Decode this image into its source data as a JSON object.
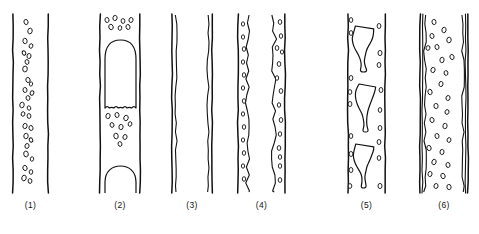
{
  "figure": {
    "title": "",
    "panel_count": 6,
    "background_color": "#ffffff",
    "ink_color": "#111111",
    "tube_top_y": 14,
    "tube_bottom_y": 193,
    "caption_y": 200
  },
  "panels": [
    {
      "id": "panel-1",
      "label": "(1)",
      "regime": "bubbly-flow",
      "x": 0,
      "width": 80,
      "wall_left": 13,
      "wall_right": 48,
      "wall_style": "single",
      "inner_film": false,
      "large_bubbles": [],
      "bubbles": [
        {
          "cx": 26,
          "cy": 22,
          "rx": 2.0,
          "ry": 2.6,
          "rot": -18
        },
        {
          "cx": 30,
          "cy": 31,
          "rx": 2.2,
          "ry": 2.8,
          "rot": 12
        },
        {
          "cx": 25,
          "cy": 41,
          "rx": 2.1,
          "ry": 2.7,
          "rot": -10
        },
        {
          "cx": 31,
          "cy": 46,
          "rx": 1.8,
          "ry": 2.3,
          "rot": 20
        },
        {
          "cx": 24,
          "cy": 53,
          "rx": 1.7,
          "ry": 2.2,
          "rot": -25
        },
        {
          "cx": 29,
          "cy": 56,
          "rx": 2.0,
          "ry": 2.5,
          "rot": 8
        },
        {
          "cx": 27,
          "cy": 62,
          "rx": 1.9,
          "ry": 2.4,
          "rot": -14
        },
        {
          "cx": 25,
          "cy": 69,
          "rx": 2.3,
          "ry": 2.9,
          "rot": 6
        },
        {
          "cx": 28,
          "cy": 80,
          "rx": 2.1,
          "ry": 2.6,
          "rot": -20
        },
        {
          "cx": 31,
          "cy": 84,
          "rx": 1.6,
          "ry": 2.1,
          "rot": 15
        },
        {
          "cx": 25,
          "cy": 90,
          "rx": 2.0,
          "ry": 2.5,
          "rot": -8
        },
        {
          "cx": 32,
          "cy": 93,
          "rx": 1.8,
          "ry": 2.3,
          "rot": 22
        },
        {
          "cx": 28,
          "cy": 98,
          "rx": 1.9,
          "ry": 2.4,
          "rot": -12
        },
        {
          "cx": 22,
          "cy": 105,
          "rx": 2.2,
          "ry": 2.8,
          "rot": 10
        },
        {
          "cx": 29,
          "cy": 108,
          "rx": 1.7,
          "ry": 2.2,
          "rot": -18
        },
        {
          "cx": 23,
          "cy": 114,
          "rx": 1.8,
          "ry": 2.3,
          "rot": 16
        },
        {
          "cx": 29,
          "cy": 116,
          "rx": 1.9,
          "ry": 2.4,
          "rot": -6
        },
        {
          "cx": 25,
          "cy": 126,
          "rx": 2.1,
          "ry": 2.6,
          "rot": 14
        },
        {
          "cx": 31,
          "cy": 128,
          "rx": 2.0,
          "ry": 2.5,
          "rot": -16
        },
        {
          "cx": 26,
          "cy": 136,
          "rx": 2.2,
          "ry": 2.7,
          "rot": 8
        },
        {
          "cx": 31,
          "cy": 140,
          "rx": 1.7,
          "ry": 2.2,
          "rot": -22
        },
        {
          "cx": 27,
          "cy": 146,
          "rx": 2.0,
          "ry": 2.5,
          "rot": 18
        },
        {
          "cx": 26,
          "cy": 154,
          "rx": 2.3,
          "ry": 2.9,
          "rot": -10
        },
        {
          "cx": 32,
          "cy": 159,
          "rx": 1.7,
          "ry": 2.2,
          "rot": 12
        },
        {
          "cx": 25,
          "cy": 168,
          "rx": 2.1,
          "ry": 2.6,
          "rot": -20
        },
        {
          "cx": 31,
          "cy": 172,
          "rx": 1.8,
          "ry": 2.3,
          "rot": 6
        },
        {
          "cx": 24,
          "cy": 178,
          "rx": 2.2,
          "ry": 2.8,
          "rot": 16
        },
        {
          "cx": 30,
          "cy": 181,
          "rx": 1.9,
          "ry": 2.4,
          "rot": -8
        }
      ]
    },
    {
      "id": "panel-2",
      "label": "(2)",
      "regime": "slug-flow",
      "x": 80,
      "width": 80,
      "wall_left": 100,
      "wall_right": 140,
      "wall_style": "single",
      "inner_film": false,
      "large_bubbles": [
        {
          "type": "taylor",
          "top": 40,
          "bottom": 108,
          "left": 105,
          "right": 136
        },
        {
          "type": "cap",
          "top": 166,
          "bottom": 193,
          "left": 105,
          "right": 136
        }
      ],
      "bubbles": [
        {
          "cx": 107,
          "cy": 20,
          "rx": 2.0,
          "ry": 2.5,
          "rot": -12
        },
        {
          "cx": 115,
          "cy": 18,
          "rx": 2.1,
          "ry": 2.6,
          "rot": 10
        },
        {
          "cx": 123,
          "cy": 21,
          "rx": 1.9,
          "ry": 2.4,
          "rot": -6
        },
        {
          "cx": 131,
          "cy": 20,
          "rx": 2.0,
          "ry": 2.5,
          "rot": 16
        },
        {
          "cx": 111,
          "cy": 27,
          "rx": 2.2,
          "ry": 2.7,
          "rot": -18
        },
        {
          "cx": 120,
          "cy": 28,
          "rx": 1.8,
          "ry": 2.3,
          "rot": 8
        },
        {
          "cx": 128,
          "cy": 27,
          "rx": 2.0,
          "ry": 2.5,
          "rot": -14
        },
        {
          "cx": 108,
          "cy": 116,
          "rx": 2.1,
          "ry": 2.6,
          "rot": 12
        },
        {
          "cx": 117,
          "cy": 115,
          "rx": 2.0,
          "ry": 2.5,
          "rot": -10
        },
        {
          "cx": 126,
          "cy": 118,
          "rx": 2.2,
          "ry": 2.7,
          "rot": 18
        },
        {
          "cx": 112,
          "cy": 125,
          "rx": 1.9,
          "ry": 2.4,
          "rot": -20
        },
        {
          "cx": 121,
          "cy": 127,
          "rx": 2.1,
          "ry": 2.6,
          "rot": 6
        },
        {
          "cx": 130,
          "cy": 124,
          "rx": 1.8,
          "ry": 2.3,
          "rot": 14
        },
        {
          "cx": 116,
          "cy": 136,
          "rx": 2.2,
          "ry": 2.8,
          "rot": -8
        },
        {
          "cx": 125,
          "cy": 137,
          "rx": 2.0,
          "ry": 2.5,
          "rot": 20
        },
        {
          "cx": 120,
          "cy": 144,
          "rx": 1.9,
          "ry": 2.4,
          "rot": -16
        }
      ]
    },
    {
      "id": "panel-3",
      "label": "(3)",
      "regime": "annular-flow",
      "x": 160,
      "width": 80,
      "wall_left": 172,
      "wall_right": 212,
      "wall_style": "single",
      "inner_film": true,
      "film_left_x": 176,
      "film_right_x": 208,
      "large_bubbles": [],
      "bubbles": []
    },
    {
      "id": "panel-4",
      "label": "(4)",
      "regime": "wavy-annular-flow",
      "x": 240,
      "width": 80,
      "wall_left": 238,
      "wall_right": 285,
      "wall_style": "single",
      "inner_film": true,
      "film_left_x": 248,
      "film_right_x": 274,
      "large_bubbles": [],
      "bubbles": [
        {
          "cx": 243,
          "cy": 24,
          "rx": 1.6,
          "ry": 2.2,
          "rot": 0
        },
        {
          "cx": 243,
          "cy": 37,
          "rx": 1.6,
          "ry": 2.2,
          "rot": 0
        },
        {
          "cx": 244,
          "cy": 49,
          "rx": 1.7,
          "ry": 2.3,
          "rot": 0
        },
        {
          "cx": 243,
          "cy": 62,
          "rx": 1.6,
          "ry": 2.2,
          "rot": 0
        },
        {
          "cx": 244,
          "cy": 75,
          "rx": 1.7,
          "ry": 2.3,
          "rot": 0
        },
        {
          "cx": 243,
          "cy": 88,
          "rx": 1.6,
          "ry": 2.2,
          "rot": 0
        },
        {
          "cx": 244,
          "cy": 101,
          "rx": 1.7,
          "ry": 2.3,
          "rot": 0
        },
        {
          "cx": 243,
          "cy": 114,
          "rx": 1.6,
          "ry": 2.2,
          "rot": 0
        },
        {
          "cx": 244,
          "cy": 127,
          "rx": 1.7,
          "ry": 2.3,
          "rot": 0
        },
        {
          "cx": 243,
          "cy": 140,
          "rx": 1.6,
          "ry": 2.2,
          "rot": 0
        },
        {
          "cx": 244,
          "cy": 153,
          "rx": 1.7,
          "ry": 2.3,
          "rot": 0
        },
        {
          "cx": 243,
          "cy": 166,
          "rx": 1.6,
          "ry": 2.2,
          "rot": 0
        },
        {
          "cx": 244,
          "cy": 179,
          "rx": 1.7,
          "ry": 2.3,
          "rot": 0
        },
        {
          "cx": 280,
          "cy": 22,
          "rx": 1.8,
          "ry": 2.4,
          "rot": 0
        },
        {
          "cx": 281,
          "cy": 36,
          "rx": 1.7,
          "ry": 2.3,
          "rot": 0
        },
        {
          "cx": 277,
          "cy": 48,
          "rx": 1.8,
          "ry": 2.4,
          "rot": 0
        },
        {
          "cx": 282,
          "cy": 52,
          "rx": 1.6,
          "ry": 2.1,
          "rot": 0
        },
        {
          "cx": 279,
          "cy": 64,
          "rx": 1.8,
          "ry": 2.4,
          "rot": 0
        },
        {
          "cx": 277,
          "cy": 78,
          "rx": 1.7,
          "ry": 2.3,
          "rot": 0
        },
        {
          "cx": 281,
          "cy": 91,
          "rx": 1.8,
          "ry": 2.4,
          "rot": 0
        },
        {
          "cx": 279,
          "cy": 105,
          "rx": 1.7,
          "ry": 2.3,
          "rot": 0
        },
        {
          "cx": 281,
          "cy": 120,
          "rx": 1.8,
          "ry": 2.4,
          "rot": 0
        },
        {
          "cx": 280,
          "cy": 134,
          "rx": 1.7,
          "ry": 2.3,
          "rot": 0
        },
        {
          "cx": 279,
          "cy": 148,
          "rx": 1.8,
          "ry": 2.4,
          "rot": 0
        },
        {
          "cx": 280,
          "cy": 157,
          "rx": 1.7,
          "ry": 2.3,
          "rot": 0
        },
        {
          "cx": 280,
          "cy": 166,
          "rx": 1.7,
          "ry": 2.3,
          "rot": 0
        },
        {
          "cx": 280,
          "cy": 180,
          "rx": 1.8,
          "ry": 2.4,
          "rot": 0
        }
      ]
    },
    {
      "id": "panel-5",
      "label": "(5)",
      "regime": "churn-flow",
      "x": 320,
      "width": 80,
      "wall_left": 348,
      "wall_right": 385,
      "wall_style": "single",
      "inner_film": false,
      "large_bubbles": [
        {
          "type": "blob",
          "top": 26,
          "bottom": 72,
          "left": 352,
          "right": 374
        },
        {
          "type": "blob",
          "top": 84,
          "bottom": 132,
          "left": 355,
          "right": 376
        },
        {
          "type": "blob",
          "top": 144,
          "bottom": 188,
          "left": 353,
          "right": 374
        }
      ],
      "bubbles": [
        {
          "cx": 351,
          "cy": 20,
          "rx": 1.8,
          "ry": 2.4,
          "rot": 0
        },
        {
          "cx": 351,
          "cy": 33,
          "rx": 1.8,
          "ry": 2.4,
          "rot": 0
        },
        {
          "cx": 379,
          "cy": 26,
          "rx": 1.9,
          "ry": 2.5,
          "rot": 0
        },
        {
          "cx": 380,
          "cy": 53,
          "rx": 2.0,
          "ry": 2.6,
          "rot": 0
        },
        {
          "cx": 379,
          "cy": 65,
          "rx": 1.9,
          "ry": 2.5,
          "rot": 0
        },
        {
          "cx": 351,
          "cy": 78,
          "rx": 1.9,
          "ry": 2.5,
          "rot": 0
        },
        {
          "cx": 350,
          "cy": 92,
          "rx": 1.8,
          "ry": 2.4,
          "rot": 0
        },
        {
          "cx": 350,
          "cy": 104,
          "rx": 1.9,
          "ry": 2.5,
          "rot": 0
        },
        {
          "cx": 381,
          "cy": 90,
          "rx": 1.9,
          "ry": 2.5,
          "rot": 0
        },
        {
          "cx": 380,
          "cy": 110,
          "rx": 1.8,
          "ry": 2.4,
          "rot": 0
        },
        {
          "cx": 380,
          "cy": 128,
          "rx": 1.9,
          "ry": 2.5,
          "rot": 0
        },
        {
          "cx": 351,
          "cy": 136,
          "rx": 1.8,
          "ry": 2.4,
          "rot": 0
        },
        {
          "cx": 379,
          "cy": 142,
          "rx": 1.9,
          "ry": 2.5,
          "rot": 0
        },
        {
          "cx": 351,
          "cy": 154,
          "rx": 1.9,
          "ry": 2.5,
          "rot": 0
        },
        {
          "cx": 379,
          "cy": 158,
          "rx": 1.8,
          "ry": 2.4,
          "rot": 0
        },
        {
          "cx": 351,
          "cy": 170,
          "rx": 1.9,
          "ry": 2.5,
          "rot": 0
        },
        {
          "cx": 350,
          "cy": 186,
          "rx": 1.8,
          "ry": 2.4,
          "rot": 0
        },
        {
          "cx": 380,
          "cy": 186,
          "rx": 2.0,
          "ry": 2.6,
          "rot": 0
        }
      ]
    },
    {
      "id": "panel-6",
      "label": "(6)",
      "regime": "dispersed-bubble-flow",
      "x": 400,
      "width": 79,
      "wall_left": 420,
      "wall_right": 468,
      "wall_style": "double",
      "inner_film": true,
      "film_left_x": 425,
      "film_right_x": 463,
      "large_bubbles": [],
      "bubbles": [
        {
          "cx": 434,
          "cy": 22,
          "rx": 2.0,
          "ry": 2.6,
          "rot": -10
        },
        {
          "cx": 444,
          "cy": 30,
          "rx": 2.1,
          "ry": 2.7,
          "rot": 12
        },
        {
          "cx": 432,
          "cy": 36,
          "rx": 2.0,
          "ry": 2.5,
          "rot": -16
        },
        {
          "cx": 449,
          "cy": 40,
          "rx": 2.2,
          "ry": 2.8,
          "rot": 8
        },
        {
          "cx": 428,
          "cy": 48,
          "rx": 1.9,
          "ry": 2.4,
          "rot": 18
        },
        {
          "cx": 437,
          "cy": 47,
          "rx": 2.0,
          "ry": 2.5,
          "rot": -12
        },
        {
          "cx": 442,
          "cy": 60,
          "rx": 2.1,
          "ry": 2.7,
          "rot": 6
        },
        {
          "cx": 452,
          "cy": 57,
          "rx": 2.0,
          "ry": 2.6,
          "rot": -20
        },
        {
          "cx": 433,
          "cy": 70,
          "rx": 2.1,
          "ry": 2.6,
          "rot": 14
        },
        {
          "cx": 446,
          "cy": 73,
          "rx": 1.9,
          "ry": 2.4,
          "rot": -8
        },
        {
          "cx": 441,
          "cy": 84,
          "rx": 2.0,
          "ry": 2.6,
          "rot": 10
        },
        {
          "cx": 430,
          "cy": 92,
          "rx": 2.1,
          "ry": 2.7,
          "rot": -14
        },
        {
          "cx": 448,
          "cy": 98,
          "rx": 2.0,
          "ry": 2.5,
          "rot": 16
        },
        {
          "cx": 436,
          "cy": 106,
          "rx": 2.1,
          "ry": 2.6,
          "rot": -6
        },
        {
          "cx": 447,
          "cy": 112,
          "rx": 1.9,
          "ry": 2.4,
          "rot": 20
        },
        {
          "cx": 432,
          "cy": 120,
          "rx": 2.0,
          "ry": 2.6,
          "rot": -18
        },
        {
          "cx": 445,
          "cy": 126,
          "rx": 2.1,
          "ry": 2.7,
          "rot": 8
        },
        {
          "cx": 437,
          "cy": 136,
          "rx": 2.0,
          "ry": 2.5,
          "rot": -10
        },
        {
          "cx": 449,
          "cy": 140,
          "rx": 1.9,
          "ry": 2.4,
          "rot": 14
        },
        {
          "cx": 429,
          "cy": 148,
          "rx": 2.1,
          "ry": 2.6,
          "rot": -16
        },
        {
          "cx": 442,
          "cy": 152,
          "rx": 2.0,
          "ry": 2.6,
          "rot": 6
        },
        {
          "cx": 434,
          "cy": 162,
          "rx": 2.1,
          "ry": 2.7,
          "rot": 18
        },
        {
          "cx": 448,
          "cy": 165,
          "rx": 2.0,
          "ry": 2.5,
          "rot": -12
        },
        {
          "cx": 430,
          "cy": 174,
          "rx": 2.0,
          "ry": 2.6,
          "rot": 10
        },
        {
          "cx": 443,
          "cy": 176,
          "rx": 2.1,
          "ry": 2.7,
          "rot": -20
        },
        {
          "cx": 436,
          "cy": 186,
          "rx": 2.0,
          "ry": 2.5,
          "rot": 12
        },
        {
          "cx": 449,
          "cy": 187,
          "rx": 2.1,
          "ry": 2.6,
          "rot": -8
        }
      ]
    }
  ]
}
